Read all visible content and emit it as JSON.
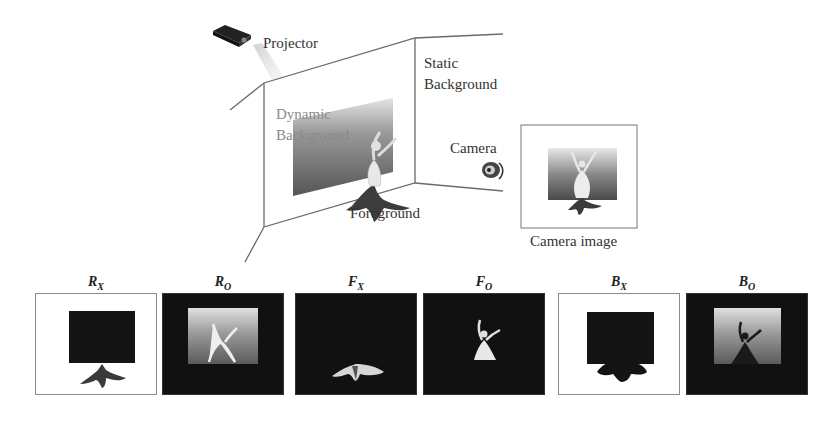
{
  "scene": {
    "labels": {
      "projector": "Projector",
      "static_background_line1": "Static",
      "static_background_line2": "Background",
      "dynamic_background_line1": "Dynamic",
      "dynamic_background_line2": "Background",
      "camera": "Camera",
      "foreground": "Foreground",
      "camera_image": "Camera image"
    },
    "icons": [
      "projector-icon",
      "camera-icon",
      "dancer-figure"
    ]
  },
  "panels": [
    {
      "id": "rx",
      "symbol": "R",
      "subscript": "X",
      "style": "white"
    },
    {
      "id": "ro",
      "symbol": "R",
      "subscript": "O",
      "style": "black"
    },
    {
      "id": "fx",
      "symbol": "F",
      "subscript": "X",
      "style": "black"
    },
    {
      "id": "fo",
      "symbol": "F",
      "subscript": "O",
      "style": "black"
    },
    {
      "id": "bx",
      "symbol": "B",
      "subscript": "X",
      "style": "white"
    },
    {
      "id": "bo",
      "symbol": "B",
      "subscript": "O",
      "style": "black"
    }
  ],
  "colors": {
    "line": "#6a6a6a",
    "panel_black": "#111111",
    "gradient_top": "#d8d8d8",
    "gradient_bottom": "#555555"
  }
}
